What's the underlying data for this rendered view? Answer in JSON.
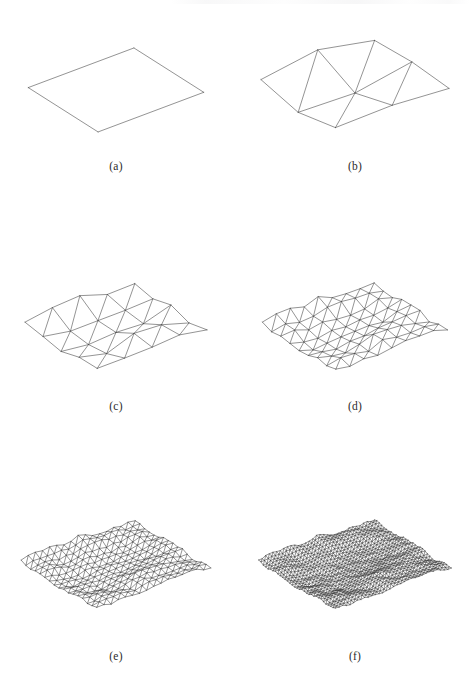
{
  "figure": {
    "background_color": "#ffffff",
    "line_color": "#3a3a3a",
    "label_color": "#2b2b2b",
    "width": 474,
    "height": 679,
    "columns": 2,
    "rows": 3
  },
  "panels": [
    {
      "id": "a",
      "label": "(a)",
      "subdivision_level": 0,
      "grid_n": 1,
      "vertex_count": 4,
      "roughness": 0.0,
      "x": 0,
      "y": 12,
      "w": 232,
      "h": 150,
      "label_y": 160,
      "projection": {
        "ox": 118,
        "oy": 78,
        "ax": 1.12,
        "ay": -0.42,
        "bx": -0.74,
        "by": -0.47,
        "az": -1.0,
        "span": 96
      }
    },
    {
      "id": "b",
      "label": "(b)",
      "subdivision_level": 1,
      "grid_n": 2,
      "vertex_count": 9,
      "roughness": 1.0,
      "x": 236,
      "y": 12,
      "w": 238,
      "h": 150,
      "label_y": 160,
      "projection": {
        "ox": 118,
        "oy": 72,
        "ax": 1.16,
        "ay": -0.4,
        "bx": -0.76,
        "by": -0.49,
        "az": -1.0,
        "span": 98
      }
    },
    {
      "id": "c",
      "label": "(c)",
      "subdivision_level": 2,
      "grid_n": 4,
      "vertex_count": 25,
      "roughness": 0.72,
      "x": 0,
      "y": 252,
      "w": 232,
      "h": 148,
      "label_y": 400,
      "projection": {
        "ox": 118,
        "oy": 74,
        "ax": 1.14,
        "ay": -0.4,
        "bx": -0.75,
        "by": -0.48,
        "az": -1.0,
        "span": 98
      }
    },
    {
      "id": "d",
      "label": "(d)",
      "subdivision_level": 3,
      "grid_n": 8,
      "vertex_count": 81,
      "roughness": 0.58,
      "x": 236,
      "y": 252,
      "w": 238,
      "h": 148,
      "label_y": 400,
      "projection": {
        "ox": 118,
        "oy": 74,
        "ax": 1.14,
        "ay": -0.4,
        "bx": -0.75,
        "by": -0.48,
        "az": -1.0,
        "span": 98
      }
    },
    {
      "id": "e",
      "label": "(e)",
      "subdivision_level": 4,
      "grid_n": 16,
      "vertex_count": 289,
      "roughness": 0.5,
      "x": 0,
      "y": 486,
      "w": 232,
      "h": 158,
      "label_y": 650,
      "projection": {
        "ox": 118,
        "oy": 78,
        "ax": 1.16,
        "ay": -0.4,
        "bx": -0.77,
        "by": -0.48,
        "az": -1.0,
        "span": 100
      }
    },
    {
      "id": "f",
      "label": "(f)",
      "subdivision_level": 5,
      "grid_n": 32,
      "vertex_count": 1089,
      "roughness": 0.46,
      "x": 236,
      "y": 486,
      "w": 238,
      "h": 158,
      "label_y": 650,
      "projection": {
        "ox": 118,
        "oy": 78,
        "ax": 1.16,
        "ay": -0.4,
        "bx": -0.77,
        "by": -0.48,
        "az": -1.0,
        "span": 100
      }
    }
  ],
  "chart_data": {
    "type": "line",
    "xlabel": "",
    "ylabel": "",
    "categories": [
      "(a)",
      "(b)",
      "(c)",
      "(d)",
      "(e)",
      "(f)"
    ],
    "series": [
      {
        "name": "subdivision level",
        "values": [
          0,
          1,
          2,
          3,
          4,
          5
        ]
      },
      {
        "name": "grid resolution (n x n)",
        "values": [
          1,
          2,
          4,
          8,
          16,
          32
        ]
      },
      {
        "name": "vertex count",
        "values": [
          4,
          9,
          25,
          81,
          289,
          1089
        ]
      },
      {
        "name": "triangle count",
        "values": [
          2,
          8,
          32,
          128,
          512,
          2048
        ]
      }
    ],
    "legend_position": "none",
    "grid": false,
    "annotations": [
      "(a) initial flat quadrilateral patch",
      "(b) first midpoint-displacement subdivision",
      "(c) second subdivision",
      "(d) third subdivision",
      "(e) fourth subdivision",
      "(f) fifth subdivision"
    ]
  },
  "terrain_seed": 20250413,
  "terrain_base_amplitude": 0.34
}
